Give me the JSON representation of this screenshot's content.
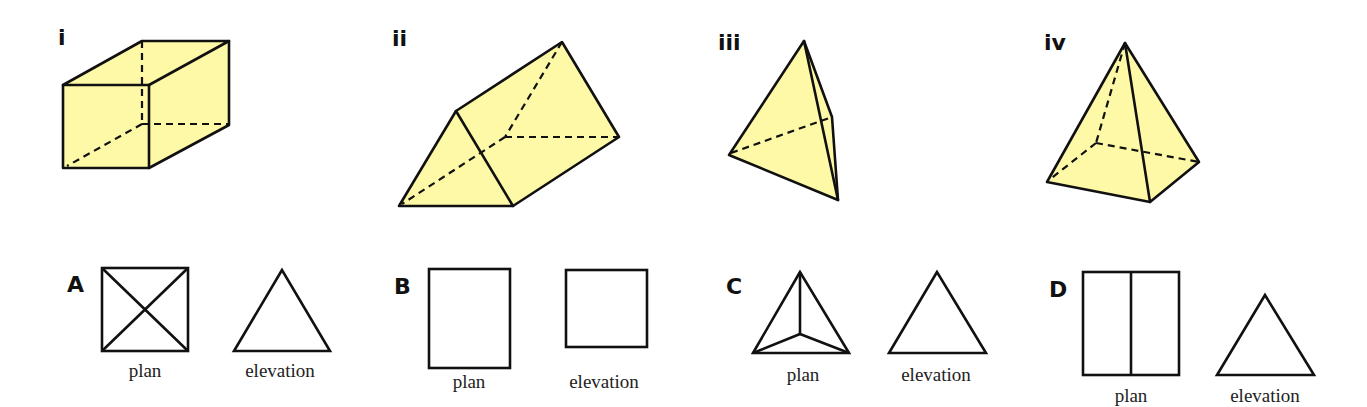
{
  "colors": {
    "solid_fill": "#fef9a6",
    "line": "#111111",
    "background": "#ffffff"
  },
  "solids": [
    {
      "label": "i",
      "name": "cuboid"
    },
    {
      "label": "ii",
      "name": "triangular prism"
    },
    {
      "label": "iii",
      "name": "tetrahedron"
    },
    {
      "label": "iv",
      "name": "square-based pyramid"
    }
  ],
  "views": [
    {
      "letter": "A",
      "plan_caption": "plan",
      "elevation_caption": "elevation",
      "plan_shape": "square with both diagonals",
      "elevation_shape": "triangle"
    },
    {
      "letter": "B",
      "plan_caption": "plan",
      "elevation_caption": "elevation",
      "plan_shape": "rectangle",
      "elevation_shape": "square"
    },
    {
      "letter": "C",
      "plan_caption": "plan",
      "elevation_caption": "elevation",
      "plan_shape": "triangle with lines from centre to vertices",
      "elevation_shape": "triangle"
    },
    {
      "letter": "D",
      "plan_caption": "plan",
      "elevation_caption": "elevation",
      "plan_shape": "rectangle split by vertical line",
      "elevation_shape": "triangle"
    }
  ]
}
